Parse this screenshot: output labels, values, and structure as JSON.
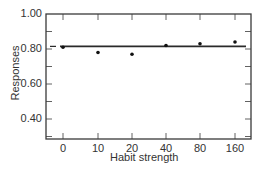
{
  "chart_data": {
    "type": "scatter",
    "title": "",
    "xlabel": "Habit strength",
    "ylabel": "Responses",
    "categories": [
      "0",
      "10",
      "20",
      "40",
      "80",
      "160"
    ],
    "series": [
      {
        "name": "Observed",
        "values": [
          0.81,
          0.78,
          0.77,
          0.82,
          0.83,
          0.84
        ]
      },
      {
        "name": "Reference line",
        "values": [
          0.815,
          0.815,
          0.815,
          0.815,
          0.815,
          0.815
        ]
      }
    ],
    "yticks": [
      "1.00",
      "0.80",
      "0.60",
      "0.40"
    ],
    "ytick_values": [
      1.0,
      0.8,
      0.6,
      0.4
    ],
    "ylim": [
      0.285,
      1.0
    ],
    "grid": false,
    "legend": "none"
  },
  "colors": {
    "axis": "#3a3a3a",
    "marker": "#111111",
    "line": "#2a2a2a"
  }
}
